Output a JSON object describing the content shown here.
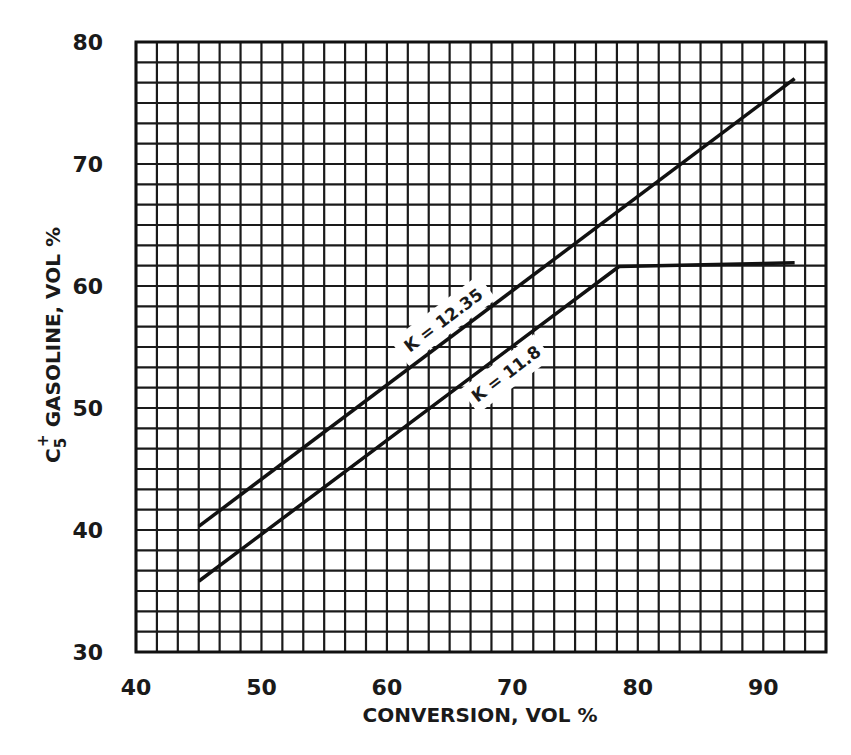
{
  "chart_data": {
    "type": "line",
    "title": "",
    "xlabel": "CONVERSION, VOL %",
    "ylabel": "C5+ GASOLINE, VOL %",
    "ylabel_parts": {
      "main": "C",
      "sub": "5",
      "sup": "+",
      "rest": " GASOLINE, VOL %"
    },
    "xlim": [
      40,
      95
    ],
    "ylim": [
      30,
      80
    ],
    "xticks": [
      40,
      50,
      60,
      70,
      80,
      90
    ],
    "yticks": [
      30,
      40,
      50,
      60,
      70,
      80
    ],
    "xtick_labels": [
      "40",
      "50",
      "60",
      "70",
      "80",
      "90"
    ],
    "ytick_labels": [
      "30",
      "40",
      "50",
      "60",
      "70",
      "80"
    ],
    "grid": true,
    "grid_minor_step": 1.67,
    "legend": "inline labels on curves",
    "series": [
      {
        "name": "K = 12.35",
        "label": "K = 12.35",
        "x": [
          45,
          92.5
        ],
        "y": [
          40.3,
          77.0
        ]
      },
      {
        "name": "K = 11.8",
        "label": "K = 11.8",
        "x": [
          45,
          78.5,
          92.5
        ],
        "y": [
          35.8,
          61.6,
          61.9
        ]
      }
    ],
    "colors": {
      "line": "#111111",
      "grid": "#1a1a1a",
      "background": "#ffffff"
    }
  }
}
